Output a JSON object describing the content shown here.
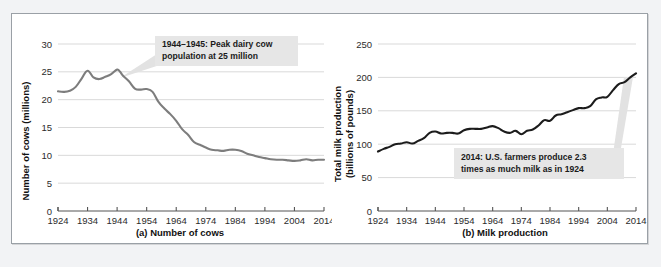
{
  "figure": {
    "panel_background": "#ffffff",
    "page_background": "#f2f3f5",
    "border_color": "#9aa0a6"
  },
  "chart_data": [
    {
      "id": "a",
      "type": "line",
      "title": "",
      "caption": "(a) Number of cows",
      "xlabel": "",
      "ylabel": "Number of cows (millions)",
      "ylabel_lines": [
        "Number of cows (millions)"
      ],
      "line_color": "#7d7d7d",
      "grid": true,
      "legend": "none",
      "xlim": [
        1924,
        2014
      ],
      "ylim": [
        0,
        30
      ],
      "yticks": [
        0,
        5,
        10,
        15,
        20,
        25,
        30
      ],
      "ytick_labels": [
        "0",
        "5",
        "10",
        "15",
        "20",
        "25",
        "30"
      ],
      "xticks": [
        1924,
        1934,
        1944,
        1954,
        1964,
        1974,
        1984,
        1994,
        2004,
        2014
      ],
      "xtick_labels": [
        "1924",
        "1934",
        "1944",
        "1954",
        "1964",
        "1974",
        "1984",
        "1994",
        "2004",
        "2014"
      ],
      "x": [
        1924,
        1926,
        1928,
        1930,
        1932,
        1934,
        1936,
        1938,
        1940,
        1942,
        1944,
        1945,
        1946,
        1948,
        1950,
        1952,
        1954,
        1956,
        1958,
        1960,
        1962,
        1964,
        1966,
        1968,
        1970,
        1972,
        1974,
        1976,
        1978,
        1980,
        1982,
        1984,
        1986,
        1988,
        1990,
        1992,
        1994,
        1996,
        1998,
        2000,
        2002,
        2004,
        2006,
        2008,
        2010,
        2012,
        2014
      ],
      "y": [
        21.5,
        21.4,
        21.6,
        22.3,
        23.8,
        25.2,
        24.0,
        23.7,
        24.1,
        24.6,
        25.4,
        25.0,
        24.3,
        23.3,
        22.0,
        21.8,
        21.9,
        21.4,
        19.6,
        18.4,
        17.4,
        16.2,
        14.7,
        13.7,
        12.4,
        11.9,
        11.4,
        11.0,
        10.9,
        10.8,
        11.0,
        11.0,
        10.8,
        10.3,
        10.0,
        9.7,
        9.5,
        9.3,
        9.2,
        9.2,
        9.1,
        9.0,
        9.1,
        9.3,
        9.1,
        9.2,
        9.2
      ],
      "annotation": {
        "text_lines": [
          "1944–1945: Peak dairy cow",
          "population at 25 million"
        ],
        "box_color": "#e6e6e6"
      }
    },
    {
      "id": "b",
      "type": "line",
      "title": "",
      "caption": "(b) Milk production",
      "xlabel": "",
      "ylabel": "Total milk production (billions of pounds)",
      "ylabel_lines": [
        "Total milk production",
        "(billions of pounds)"
      ],
      "line_color": "#1c1c1c",
      "grid": true,
      "legend": "none",
      "xlim": [
        1924,
        2014
      ],
      "ylim": [
        0,
        250
      ],
      "yticks": [
        0,
        50,
        100,
        150,
        200,
        250
      ],
      "ytick_labels": [
        "0",
        "50",
        "100",
        "150",
        "200",
        "250"
      ],
      "xticks": [
        1924,
        1934,
        1944,
        1954,
        1964,
        1974,
        1984,
        1994,
        2004,
        2014
      ],
      "xtick_labels": [
        "1924",
        "1934",
        "1944",
        "1954",
        "1964",
        "1974",
        "1984",
        "1994",
        "2004",
        "2014"
      ],
      "x": [
        1924,
        1926,
        1928,
        1930,
        1932,
        1934,
        1936,
        1938,
        1940,
        1942,
        1944,
        1946,
        1948,
        1950,
        1952,
        1954,
        1956,
        1958,
        1960,
        1962,
        1964,
        1966,
        1968,
        1970,
        1972,
        1974,
        1976,
        1978,
        1980,
        1982,
        1984,
        1986,
        1988,
        1990,
        1992,
        1994,
        1996,
        1998,
        2000,
        2002,
        2004,
        2006,
        2008,
        2010,
        2012,
        2014
      ],
      "y": [
        89,
        93,
        96,
        100,
        101,
        103,
        101,
        105,
        109,
        117,
        119,
        116,
        117,
        117,
        116,
        121,
        123,
        123,
        123,
        125,
        127,
        124,
        119,
        117,
        120,
        115,
        120,
        122,
        128,
        136,
        135,
        143,
        145,
        148,
        151,
        154,
        154,
        157,
        167,
        170,
        171,
        181,
        190,
        193,
        200,
        206
      ],
      "annotation": {
        "text_lines": [
          "2014: U.S. farmers produce 2.3",
          "times as much milk as in 1924"
        ],
        "box_color": "#e6e6e6"
      }
    }
  ]
}
